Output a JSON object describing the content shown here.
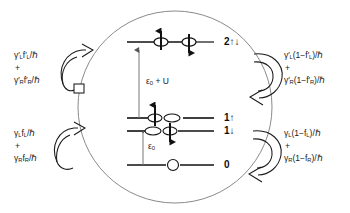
{
  "figure": {
    "type": "energy-level-rate-diagram",
    "background_color": "#ffffff",
    "line_color": "#111111",
    "ellipse_color": "#8a8a8a"
  },
  "rates": {
    "upper_left": {
      "name": "in-rate-doubly-occupied",
      "term1": "γ′L f′L/ℏ",
      "term1_symbol": "γ",
      "term1_prime": "′",
      "term1_sub": "L",
      "term1_f": "f",
      "term1_f_prime": "′",
      "term1_f_sub": "L",
      "term1_tail": "/ℏ",
      "plus": "+",
      "term2_symbol": "γ",
      "term2_prime": "′",
      "term2_sub": "R",
      "term2_f": "f",
      "term2_f_prime": "′",
      "term2_f_sub": "R",
      "term2_tail": "/ℏ"
    },
    "lower_left": {
      "name": "in-rate-singly-occupied",
      "term1_symbol": "γ",
      "term1_prime": "",
      "term1_sub": "L",
      "term1_f": "f",
      "term1_f_prime": "",
      "term1_f_sub": "L",
      "term1_tail": "/ℏ",
      "plus": "+",
      "term2_symbol": "γ",
      "term2_prime": "",
      "term2_sub": "R",
      "term2_f": "f",
      "term2_f_prime": "",
      "term2_f_sub": "R",
      "term2_tail": "/ℏ"
    },
    "upper_right": {
      "name": "out-rate-doubly-occupied",
      "term1_symbol": "γ",
      "term1_prime": "′",
      "term1_sub": "L",
      "term1_open": "(1−f",
      "term1_f_prime": "′",
      "term1_f_sub": "L",
      "term1_tail": ")/ℏ",
      "plus": "+",
      "term2_symbol": "γ",
      "term2_prime": "′",
      "term2_sub": "R",
      "term2_open": "(1−f",
      "term2_f_prime": "′",
      "term2_f_sub": "R",
      "term2_tail": ")/ℏ"
    },
    "lower_right": {
      "name": "out-rate-singly-occupied",
      "term1_symbol": "γ",
      "term1_prime": "",
      "term1_sub": "L",
      "term1_open": "(1−f",
      "term1_f_prime": "",
      "term1_f_sub": "L",
      "term1_tail": ")/ℏ",
      "plus": "+",
      "term2_symbol": "γ",
      "term2_prime": "",
      "term2_sub": "R",
      "term2_open": "(1−f",
      "term2_f_prime": "",
      "term2_f_sub": "R",
      "term2_tail": ")/ℏ"
    }
  },
  "levels": [
    {
      "id": "level-2",
      "label": "2↑↓",
      "y": 42,
      "occupancy": 2,
      "spins": [
        "up",
        "down"
      ]
    },
    {
      "id": "level-1-up",
      "label": "1↑",
      "y": 118,
      "occupancy": 1,
      "spins": [
        "up"
      ]
    },
    {
      "id": "level-1-down",
      "label": "1↓",
      "y": 130,
      "occupancy": 1,
      "spins": [
        "down"
      ]
    },
    {
      "id": "level-0",
      "label": "0",
      "y": 165,
      "occupancy": 0,
      "spins": []
    }
  ],
  "energies": {
    "upper": {
      "symbol": "ε",
      "sub": "0",
      "rest": " + U",
      "full": "ε0 + U"
    },
    "lower": {
      "symbol": "ε",
      "sub": "0",
      "rest": "",
      "full": "ε0"
    }
  },
  "arrows": {
    "upper_left": {
      "name": "curved-arrow-in-upper",
      "direction": "into-system"
    },
    "lower_left": {
      "name": "curved-arrow-in-lower",
      "direction": "into-system"
    },
    "upper_right": {
      "name": "curved-arrow-out-upper",
      "direction": "out-of-system"
    },
    "lower_right": {
      "name": "curved-arrow-out-lower",
      "direction": "out-of-system"
    }
  }
}
